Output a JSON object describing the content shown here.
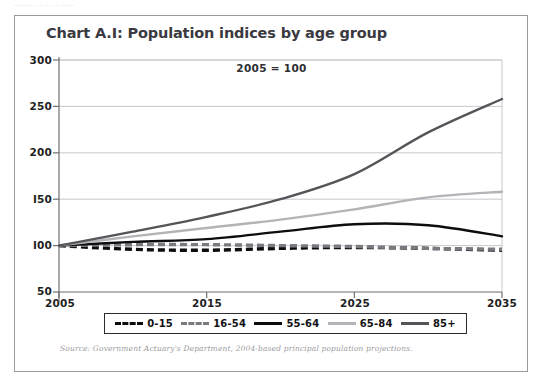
{
  "page": {
    "top_fragment": "........ .... .. ... ....."
  },
  "figure": {
    "title": "Chart A.I: Population indices by age group",
    "note": "2005 = 100",
    "source": "Source: Government Actuary's Department, 2004-based principal population projections."
  },
  "colors": {
    "frame": "#9a9a9e",
    "axis": "#6f6f74",
    "grid": "#c9c9cd",
    "title_text": "#3a3a40",
    "tick_text": "#1e1e22",
    "source_text": "#9c9ca2",
    "series_0_15": "#0d0d10",
    "series_16_54": "#7a7a80",
    "series_55_64": "#0d0d10",
    "series_65_84": "#b3b3b8",
    "series_85_plus": "#545459"
  },
  "chart_data": {
    "type": "line",
    "title": "Chart A.I: Population indices by age group",
    "subtitle": "2005 = 100",
    "xlabel": "",
    "ylabel": "",
    "xlim": [
      2005,
      2035
    ],
    "ylim": [
      50,
      300
    ],
    "xticks": [
      2005,
      2015,
      2025,
      2035
    ],
    "yticks": [
      50,
      100,
      150,
      200,
      250,
      300
    ],
    "grid": true,
    "legend_position": "bottom",
    "x": [
      2005,
      2010,
      2015,
      2020,
      2025,
      2030,
      2035
    ],
    "series": [
      {
        "name": "0-15",
        "style": "dashed",
        "color": "#0d0d10",
        "values": [
          100,
          96,
          95,
          97,
          98,
          97,
          95
        ]
      },
      {
        "name": "16-54",
        "style": "dashed",
        "color": "#7a7a80",
        "values": [
          100,
          101,
          101,
          100,
          99,
          97,
          96
        ]
      },
      {
        "name": "55-64",
        "style": "solid",
        "color": "#0d0d10",
        "values": [
          100,
          104,
          107,
          115,
          123,
          122,
          110
        ]
      },
      {
        "name": "65-84",
        "style": "solid",
        "color": "#b3b3b8",
        "values": [
          100,
          110,
          119,
          128,
          139,
          152,
          158
        ]
      },
      {
        "name": "85+",
        "style": "solid",
        "color": "#545459",
        "values": [
          100,
          115,
          131,
          150,
          177,
          222,
          258
        ]
      }
    ]
  },
  "legend": {
    "items": [
      {
        "label": "0-15",
        "color": "#0d0d10",
        "style": "dashed"
      },
      {
        "label": "16-54",
        "color": "#7a7a80",
        "style": "dashed"
      },
      {
        "label": "55-64",
        "color": "#0d0d10",
        "style": "solid"
      },
      {
        "label": "65-84",
        "color": "#b3b3b8",
        "style": "solid"
      },
      {
        "label": "85+",
        "color": "#545459",
        "style": "solid"
      }
    ]
  },
  "axes": {
    "y_ticks": [
      "300",
      "250",
      "200",
      "I50",
      "I00",
      "50"
    ],
    "x_ticks": [
      "2005",
      "2015",
      "2025",
      "2035"
    ]
  }
}
